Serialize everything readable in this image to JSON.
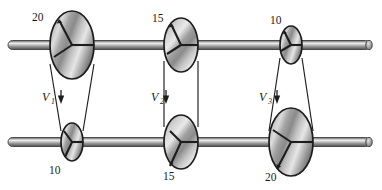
{
  "figure": {
    "name": "stepped-pulley-belt-drive",
    "background_color": "#ffffff",
    "ink_color": "#1a1a1a",
    "shaft_color_light": "#e8e8e8",
    "shaft_color_mid": "#9a9a9a",
    "shaft_color_dark": "#5a5a5a",
    "pulley_color_light": "#e2e2e2",
    "pulley_color_mid": "#a8a8a8",
    "pulley_color_dark": "#6e6e6e"
  },
  "shafts": [
    {
      "id": "upper-shaft",
      "label": "upper shaft",
      "y": 45,
      "x_start": 8,
      "x_end": 374,
      "thickness": 9,
      "cap_end": "right"
    },
    {
      "id": "lower-shaft",
      "label": "lower shaft",
      "y": 142,
      "x_start": 8,
      "x_end": 374,
      "thickness": 9,
      "cap_end": "right"
    }
  ],
  "pulleys": [
    {
      "id": "pulley-top-1",
      "shaft": "upper-shaft",
      "size_label": "20",
      "label_x": 32,
      "label_y": 21,
      "cx": 72,
      "cy": 45,
      "rx": 22,
      "ry": 34
    },
    {
      "id": "pulley-top-2",
      "shaft": "upper-shaft",
      "size_label": "15",
      "label_x": 152,
      "label_y": 22,
      "cx": 181,
      "cy": 45,
      "rx": 17,
      "ry": 27
    },
    {
      "id": "pulley-top-3",
      "shaft": "upper-shaft",
      "size_label": "10",
      "label_x": 270,
      "label_y": 24,
      "cx": 291,
      "cy": 45,
      "rx": 11,
      "ry": 19
    },
    {
      "id": "pulley-bottom-1",
      "shaft": "lower-shaft",
      "size_label": "10",
      "label_x": 49,
      "label_y": 174,
      "cx": 72,
      "cy": 142,
      "rx": 11,
      "ry": 19
    },
    {
      "id": "pulley-bottom-2",
      "shaft": "lower-shaft",
      "size_label": "15",
      "label_x": 163,
      "label_y": 180,
      "cx": 181,
      "cy": 142,
      "rx": 17,
      "ry": 27
    },
    {
      "id": "pulley-bottom-3",
      "shaft": "lower-shaft",
      "size_label": "20",
      "label_x": 265,
      "label_y": 181,
      "cx": 291,
      "cy": 142,
      "rx": 22,
      "ry": 34
    }
  ],
  "belts": [
    {
      "id": "belt-1",
      "speed_label": "V",
      "speed_subscript": "1",
      "label_x": 42,
      "label_y": 101,
      "arrow_x": 61,
      "arrow_y_start": 90,
      "arrow_y_end": 103,
      "left_top_x": 50,
      "left_top_y": 64,
      "left_bottom_x": 61,
      "left_bottom_y": 131,
      "right_top_x": 94,
      "right_top_y": 64,
      "right_bottom_x": 83,
      "right_bottom_y": 131
    },
    {
      "id": "belt-2",
      "speed_label": "V",
      "speed_subscript": "2",
      "label_x": 151,
      "label_y": 101,
      "arrow_x": 166,
      "arrow_y_start": 90,
      "arrow_y_end": 103,
      "left_top_x": 164,
      "left_top_y": 61,
      "left_bottom_x": 164,
      "left_bottom_y": 127,
      "right_top_x": 198,
      "right_top_y": 61,
      "right_bottom_x": 198,
      "right_bottom_y": 127
    },
    {
      "id": "belt-3",
      "speed_label": "V",
      "speed_subscript": "3",
      "label_x": 259,
      "label_y": 101,
      "arrow_x": 277,
      "arrow_y_start": 90,
      "arrow_y_end": 103,
      "left_top_x": 280,
      "left_top_y": 58,
      "left_bottom_x": 269,
      "left_bottom_y": 131,
      "right_top_x": 302,
      "right_top_y": 58,
      "right_bottom_x": 313,
      "right_bottom_y": 131
    }
  ]
}
